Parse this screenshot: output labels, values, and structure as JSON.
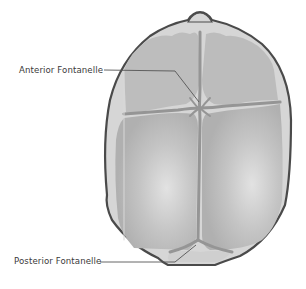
{
  "diagram": {
    "labels": [
      {
        "id": "anterior",
        "text": "Anterior Fontanelle"
      },
      {
        "id": "posterior",
        "text": "Posterior Fontanelle"
      }
    ],
    "colors": {
      "background": "#ffffff",
      "skull_outline": "#4a4a4a",
      "outer_rim": "#d6d6d6",
      "bone_plate": "#b9b9b9",
      "bone_highlight": "#dcdcdc",
      "suture": "#8f8f8f",
      "leader_line": "#555555",
      "label_text": "#3a3a3a"
    }
  }
}
